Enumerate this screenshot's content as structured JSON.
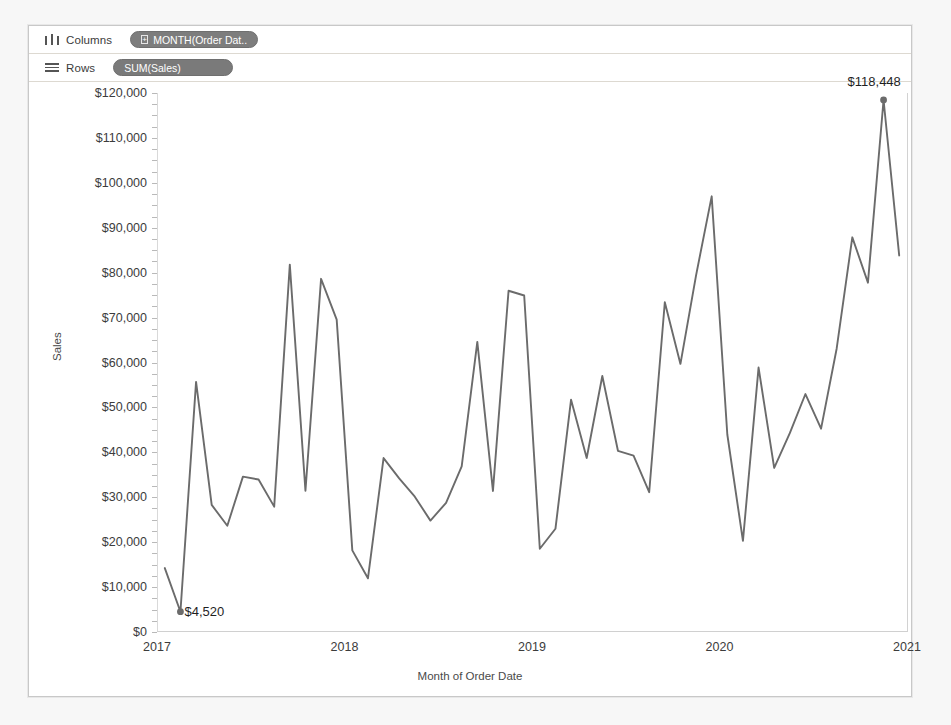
{
  "shelves": {
    "columns": {
      "label": "Columns",
      "icon": "columns-icon",
      "pill": "MONTH(Order Dat..",
      "pill_expand_glyph": "+"
    },
    "rows": {
      "label": "Rows",
      "icon": "rows-icon",
      "pill": "SUM(Sales)"
    }
  },
  "chart_data": {
    "type": "line",
    "title": "",
    "xlabel": "Month of Order Date",
    "ylabel": "Sales",
    "grid": false,
    "legend": "none",
    "line_color": "#6b6b6b",
    "xlim": [
      2017.0,
      2021.0
    ],
    "ylim": [
      0,
      120000
    ],
    "ytick_labels": [
      "$120,000",
      "$110,000",
      "$100,000",
      "$90,000",
      "$80,000",
      "$70,000",
      "$60,000",
      "$50,000",
      "$40,000",
      "$30,000",
      "$20,000",
      "$10,000",
      "$0"
    ],
    "ytick_values": [
      120000,
      110000,
      100000,
      90000,
      80000,
      70000,
      60000,
      50000,
      40000,
      30000,
      20000,
      10000,
      0
    ],
    "xtick_labels": [
      "2017",
      "2018",
      "2019",
      "2020",
      "2021"
    ],
    "xtick_values": [
      2017,
      2018,
      2019,
      2020,
      2021
    ],
    "x": [
      "2017-01",
      "2017-02",
      "2017-03",
      "2017-04",
      "2017-05",
      "2017-06",
      "2017-07",
      "2017-08",
      "2017-09",
      "2017-10",
      "2017-11",
      "2017-12",
      "2018-01",
      "2018-02",
      "2018-03",
      "2018-04",
      "2018-05",
      "2018-06",
      "2018-07",
      "2018-08",
      "2018-09",
      "2018-10",
      "2018-11",
      "2018-12",
      "2019-01",
      "2019-02",
      "2019-03",
      "2019-04",
      "2019-05",
      "2019-06",
      "2019-07",
      "2019-08",
      "2019-09",
      "2019-10",
      "2019-11",
      "2019-12",
      "2020-01",
      "2020-02",
      "2020-03",
      "2020-04",
      "2020-05",
      "2020-06",
      "2020-07",
      "2020-08",
      "2020-09",
      "2020-10",
      "2020-11",
      "2020-12"
    ],
    "values": [
      14236,
      4520,
      55691,
      28295,
      23648,
      34595,
      33946,
      27909,
      81777,
      31453,
      78629,
      69545,
      18174,
      11951,
      38726,
      34196,
      30132,
      24798,
      28765,
      36898,
      64596,
      31404,
      75973,
      74920,
      18542,
      22979,
      51715,
      38750,
      56988,
      40345,
      39262,
      31116,
      73410,
      59687,
      79412,
      96999,
      43971,
      20301,
      58872,
      36522,
      44261,
      52982,
      45264,
      63121,
      87867,
      77777,
      118448,
      83829
    ],
    "annotations": [
      {
        "name": "max-label",
        "label": "$118,448",
        "x": "2020-11",
        "value": 118448,
        "marker": true
      },
      {
        "name": "min-label",
        "label": "$4,520",
        "x": "2017-02",
        "value": 4520,
        "marker": true
      }
    ]
  }
}
